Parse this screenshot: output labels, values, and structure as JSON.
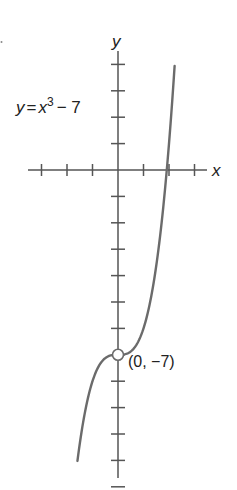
{
  "chart_data": {
    "type": "line",
    "title": "",
    "equation_label": "y = x³ − 7",
    "equation_parts": {
      "lhs": "y",
      "eq": "=",
      "var": "x",
      "exp": "3",
      "rest": "− 7"
    },
    "xlabel": "x",
    "ylabel": "y",
    "xlim": [
      -3,
      3
    ],
    "ylim": [
      -12,
      4
    ],
    "grid": false,
    "legend": null,
    "series": [
      {
        "name": "y = x^3 - 7",
        "x": [
          -1.59,
          -1.4,
          -1.2,
          -1.0,
          -0.8,
          -0.6,
          -0.4,
          -0.2,
          0,
          0.2,
          0.4,
          0.6,
          0.8,
          1.0,
          1.2,
          1.4,
          1.6,
          1.8,
          1.913,
          2.0,
          2.1,
          2.22
        ],
        "y": [
          -11.0,
          -9.74,
          -8.73,
          -8.0,
          -7.51,
          -7.22,
          -7.06,
          -7.01,
          -7.0,
          -6.99,
          -6.94,
          -6.78,
          -6.49,
          -6.0,
          -5.27,
          -4.26,
          -2.9,
          -1.17,
          0.0,
          1.0,
          2.26,
          3.94
        ]
      }
    ],
    "annotations": [
      {
        "point": [
          0,
          -7
        ],
        "marker": "open-circle",
        "text": "(0, −7)"
      }
    ],
    "x_ticks": [
      -3,
      -2,
      -1,
      1,
      2,
      3
    ],
    "y_ticks": [
      4,
      3,
      2,
      1,
      -1,
      -2,
      -3,
      -4,
      -5,
      -6,
      -7,
      -8,
      -9,
      -10,
      -11,
      -12
    ]
  },
  "colors": {
    "axis": "#555555",
    "curve": "#6b6b6b",
    "text": "#222222"
  }
}
